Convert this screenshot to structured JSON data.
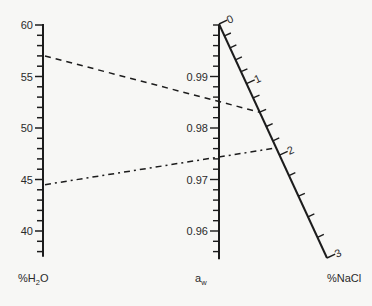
{
  "chart_data": {
    "type": "nomogram",
    "title": "",
    "axes": [
      {
        "id": "h2o",
        "name": "%H2O",
        "label_main": "%H",
        "label_sub": "2",
        "label_tail": "O",
        "range": [
          37.5,
          60
        ],
        "major_ticks": [
          60,
          55,
          50,
          45,
          40
        ],
        "major_labels": [
          "60",
          "55",
          "50",
          "45",
          "40"
        ],
        "minor_step": 1
      },
      {
        "id": "aw",
        "name": "a_w",
        "label_main": "a",
        "label_sub": "w",
        "label_tail": "",
        "range": [
          0.9545,
          1.0
        ],
        "major_ticks": [
          0.99,
          0.98,
          0.97,
          0.96
        ],
        "major_labels": [
          "0.99",
          "0.98",
          "0.97",
          "0.96"
        ],
        "minor_step": 0.002
      },
      {
        "id": "nacl",
        "name": "%NaCl",
        "label_main": "%NaCl",
        "label_sub": "",
        "label_tail": "",
        "range": [
          0,
          3
        ],
        "major_ticks": [
          0,
          1,
          2,
          3
        ],
        "major_labels": [
          "0",
          "1",
          "2",
          "3"
        ],
        "minor_step": 0.2
      }
    ],
    "isopleths": [
      {
        "name": "example-1",
        "h2o": 57,
        "aw": 0.9847,
        "nacl": 1.4,
        "style": "dashed"
      },
      {
        "name": "example-2",
        "h2o": 44.5,
        "aw": 0.9735,
        "nacl": 1.9,
        "style": "dash-dot"
      }
    ]
  }
}
